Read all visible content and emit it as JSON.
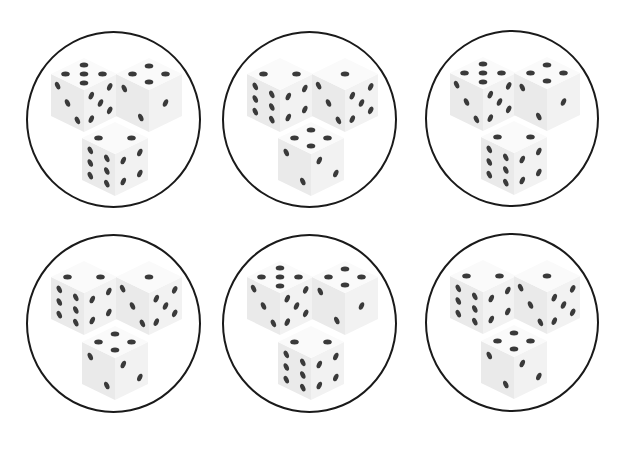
{
  "colors": {
    "background": "#ffffff",
    "circle_stroke": "#1a1a1a",
    "die_top": "#fafafa",
    "die_left": "#eaeaea",
    "die_right": "#f2f2f2",
    "pip": "#3a3a3a"
  },
  "circles": [
    {
      "x": 26,
      "y": 31,
      "w": 175,
      "h": 177,
      "dice": [
        {
          "pos": "left",
          "top": 5,
          "left": 3,
          "right": 5
        },
        {
          "pos": "right",
          "top": 4,
          "left": 2,
          "right": 1
        },
        {
          "pos": "bottom",
          "top": 2,
          "left": 6,
          "right": 4
        }
      ]
    },
    {
      "x": 222,
      "y": 31,
      "w": 175,
      "h": 177,
      "dice": [
        {
          "pos": "left",
          "top": 2,
          "left": 6,
          "right": 4
        },
        {
          "pos": "right",
          "top": 1,
          "left": 3,
          "right": 5
        },
        {
          "pos": "bottom",
          "top": 4,
          "left": 2,
          "right": 2
        }
      ]
    },
    {
      "x": 425,
      "y": 30,
      "w": 174,
      "h": 177,
      "dice": [
        {
          "pos": "left",
          "top": 5,
          "left": 3,
          "right": 5
        },
        {
          "pos": "right",
          "top": 4,
          "left": 2,
          "right": 1
        },
        {
          "pos": "bottom",
          "top": 2,
          "left": 6,
          "right": 4
        }
      ]
    },
    {
      "x": 26,
      "y": 234,
      "w": 175,
      "h": 179,
      "dice": [
        {
          "pos": "left",
          "top": 2,
          "left": 6,
          "right": 4
        },
        {
          "pos": "right",
          "top": 1,
          "left": 3,
          "right": 5
        },
        {
          "pos": "bottom",
          "top": 4,
          "left": 2,
          "right": 2
        }
      ]
    },
    {
      "x": 222,
      "y": 234,
      "w": 175,
      "h": 179,
      "dice": [
        {
          "pos": "left",
          "top": 5,
          "left": 3,
          "right": 5
        },
        {
          "pos": "right",
          "top": 4,
          "left": 2,
          "right": 1
        },
        {
          "pos": "bottom",
          "top": 2,
          "left": 6,
          "right": 4
        }
      ]
    },
    {
      "x": 425,
      "y": 233,
      "w": 174,
      "h": 179,
      "dice": [
        {
          "pos": "left",
          "top": 2,
          "left": 6,
          "right": 4
        },
        {
          "pos": "right",
          "top": 1,
          "left": 3,
          "right": 5
        },
        {
          "pos": "bottom",
          "top": 4,
          "left": 2,
          "right": 2
        }
      ]
    }
  ]
}
